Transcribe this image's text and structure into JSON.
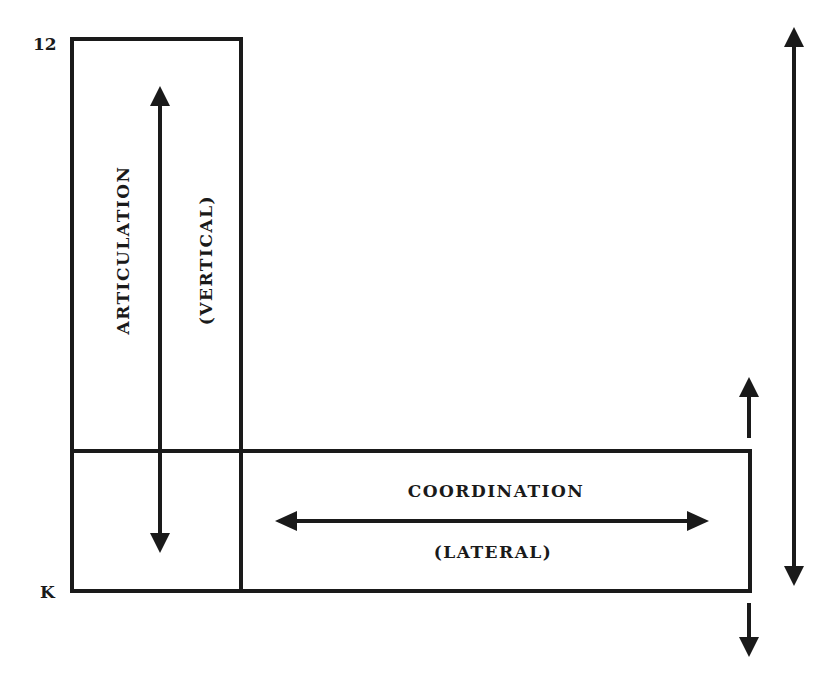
{
  "diagram": {
    "axis_labels": {
      "top": "12",
      "bottom": "K"
    },
    "vertical_box": {
      "title": "ARTICULATION",
      "subtitle": "(VERTICAL)"
    },
    "horizontal_box": {
      "title": "COORDINATION",
      "subtitle": "(LATERAL)"
    },
    "arrows": [
      {
        "name": "articulation-arrow",
        "direction": "up-down"
      },
      {
        "name": "coordination-arrow",
        "direction": "left-right"
      },
      {
        "name": "span-arrow",
        "direction": "up-down"
      },
      {
        "name": "expand-up-arrow",
        "direction": "up"
      },
      {
        "name": "expand-down-arrow",
        "direction": "down"
      }
    ],
    "colors": {
      "line": "#1a1a1a",
      "background": "#ffffff"
    }
  }
}
